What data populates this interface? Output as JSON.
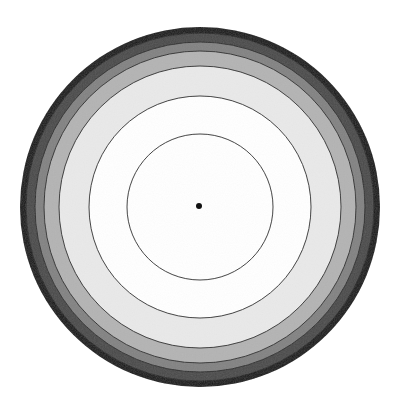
{
  "diagram": {
    "type": "concentric-circles",
    "center": {
      "x": 200,
      "y": 207
    },
    "rings": [
      {
        "name": "ring-outer-black",
        "radius": 180,
        "fill": "#1c1c1c"
      },
      {
        "name": "ring-dark-gray",
        "radius": 174,
        "fill": "#4b4b4b"
      },
      {
        "name": "ring-mid-gray",
        "radius": 165,
        "fill": "#838383"
      },
      {
        "name": "ring-light-gray",
        "radius": 156,
        "fill": "#b4b4b4"
      },
      {
        "name": "ring-off-white",
        "radius": 141,
        "fill": "#e9e9e9"
      },
      {
        "name": "ring-white",
        "radius": 111,
        "fill": "#ffffff"
      },
      {
        "name": "ring-inner",
        "radius": 73,
        "fill": "#ffffff"
      }
    ],
    "outline_color": "#2a2a2a",
    "center_dot": {
      "radius": 3,
      "fill": "#111111"
    }
  }
}
